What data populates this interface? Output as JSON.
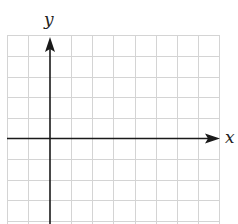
{
  "diagram": {
    "type": "coordinate-grid",
    "x_axis_label": "x",
    "y_axis_label": "y",
    "grid": {
      "columns": 10,
      "rows": 9,
      "origin_column": 2,
      "origin_row": 5,
      "line_color": "#d4d4d4",
      "axis_color": "#1a1a1a"
    }
  }
}
